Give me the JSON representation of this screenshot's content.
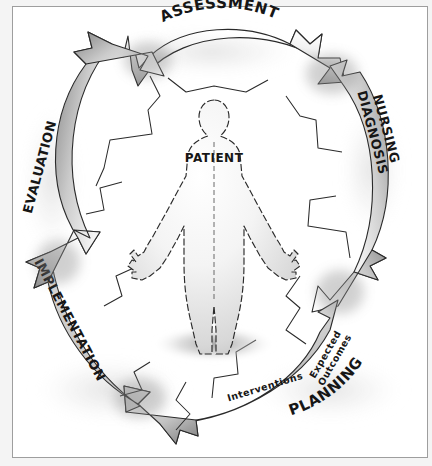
{
  "diagram": {
    "center_label": "PATIENT",
    "style": {
      "background": "#ffffff",
      "frame_color": "#9e9e9e",
      "ink_color": "#161616",
      "band_light": "#ffffff",
      "band_mid": "#c9c9c9",
      "band_dark": "#8e8e8e",
      "shadow": "#9a9a9a"
    },
    "phases": [
      {
        "id": "assessment",
        "label": "ASSESSMENT",
        "position": "top"
      },
      {
        "id": "nursing-diagnosis",
        "label_line1": "NURSING",
        "label_line2": "DIAGNOSIS",
        "position": "right"
      },
      {
        "id": "planning",
        "label": "PLANNING",
        "position": "bottom-right"
      },
      {
        "id": "implementation",
        "label": "IMPLEMENTATION",
        "position": "bottom-left"
      },
      {
        "id": "evaluation",
        "label": "EVALUATION",
        "position": "left"
      }
    ],
    "sub_labels": [
      {
        "id": "expected-outcomes",
        "label_line1": "Expected",
        "label_line2": "Outcomes",
        "belongs_to": "planning"
      },
      {
        "id": "interventions",
        "label": "Interventions",
        "belongs_to": "planning"
      }
    ]
  }
}
